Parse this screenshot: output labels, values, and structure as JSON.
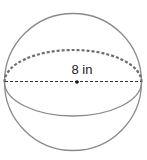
{
  "figure": {
    "shape": "sphere",
    "diameter_label": "8 in",
    "colors": {
      "outline": "#8a8a8a",
      "dashed_equator_back": "#6e6e6e",
      "diameter_line": "#333333",
      "center_dot": "#111111"
    }
  }
}
